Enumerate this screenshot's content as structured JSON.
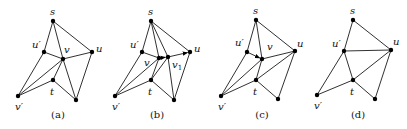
{
  "figure": {
    "panels": [
      {
        "id": "a",
        "caption": "(a)",
        "caption_pos": [
          58,
          118
        ],
        "nodes": [
          {
            "id": "s",
            "label": "s",
            "x": 53,
            "y": 21,
            "lx": 50,
            "ly": 15
          },
          {
            "id": "u_prime",
            "label": "u′",
            "x": 44,
            "y": 52,
            "lx": 32,
            "ly": 48
          },
          {
            "id": "v",
            "label": "v",
            "x": 63,
            "y": 59,
            "lx": 64,
            "ly": 53
          },
          {
            "id": "u",
            "label": "u",
            "x": 92,
            "y": 52,
            "lx": 96,
            "ly": 52
          },
          {
            "id": "t",
            "label": "t",
            "x": 53,
            "y": 80,
            "lx": 50,
            "ly": 95
          },
          {
            "id": "v_prime",
            "label": "v′",
            "x": 18,
            "y": 96,
            "lx": 15,
            "ly": 110
          },
          {
            "id": "w",
            "label": "",
            "x": 76,
            "y": 100
          }
        ],
        "edges": [
          [
            "s",
            "u_prime"
          ],
          [
            "s",
            "v"
          ],
          [
            "s",
            "u"
          ],
          [
            "u_prime",
            "v"
          ],
          [
            "v",
            "u"
          ],
          [
            "u_prime",
            "v_prime"
          ],
          [
            "v",
            "v_prime"
          ],
          [
            "v",
            "t"
          ],
          [
            "t",
            "v_prime"
          ],
          [
            "v",
            "w"
          ],
          [
            "t",
            "w"
          ],
          [
            "u",
            "w"
          ]
        ],
        "arrows": []
      },
      {
        "id": "b",
        "caption": "(b)",
        "caption_pos": [
          157,
          118
        ],
        "nodes": [
          {
            "id": "s",
            "label": "s",
            "x": 151,
            "y": 21,
            "lx": 148,
            "ly": 15
          },
          {
            "id": "u_prime",
            "label": "u′",
            "x": 142,
            "y": 52,
            "lx": 130,
            "ly": 48
          },
          {
            "id": "v",
            "label": "v",
            "x": 159,
            "y": 58,
            "lx": 144,
            "ly": 66
          },
          {
            "id": "v1",
            "label": "v1",
            "x": 168,
            "y": 57,
            "lx": 172,
            "ly": 68
          },
          {
            "id": "u",
            "label": "u",
            "x": 190,
            "y": 52,
            "lx": 194,
            "ly": 52
          },
          {
            "id": "t",
            "label": "t",
            "x": 151,
            "y": 80,
            "lx": 148,
            "ly": 95
          },
          {
            "id": "v_prime",
            "label": "v′",
            "x": 115,
            "y": 96,
            "lx": 112,
            "ly": 110
          },
          {
            "id": "w",
            "label": "",
            "x": 174,
            "y": 100
          }
        ],
        "edges": [
          [
            "s",
            "u_prime"
          ],
          [
            "s",
            "v"
          ],
          [
            "s",
            "v1"
          ],
          [
            "s",
            "u"
          ],
          [
            "u_prime",
            "v"
          ],
          [
            "u_prime",
            "v_prime"
          ],
          [
            "v",
            "v_prime"
          ],
          [
            "v",
            "t"
          ],
          [
            "v1",
            "t"
          ],
          [
            "t",
            "v_prime"
          ],
          [
            "v1",
            "w"
          ],
          [
            "t",
            "w"
          ],
          [
            "u",
            "w"
          ]
        ],
        "arrows": [
          [
            "v",
            "v1"
          ],
          [
            "v1",
            "u"
          ]
        ]
      },
      {
        "id": "c",
        "caption": "(c)",
        "caption_pos": [
          262,
          118
        ],
        "nodes": [
          {
            "id": "s",
            "label": "s",
            "x": 256,
            "y": 20,
            "lx": 253,
            "ly": 14
          },
          {
            "id": "u_prime",
            "label": "u′",
            "x": 247,
            "y": 52,
            "lx": 235,
            "ly": 46
          },
          {
            "id": "v",
            "label": "v",
            "x": 262,
            "y": 59,
            "lx": 267,
            "ly": 50
          },
          {
            "id": "u",
            "label": "u",
            "x": 295,
            "y": 51,
            "lx": 297,
            "ly": 47
          },
          {
            "id": "t",
            "label": "t",
            "x": 256,
            "y": 80,
            "lx": 253,
            "ly": 95
          },
          {
            "id": "v_prime",
            "label": "v′",
            "x": 221,
            "y": 96,
            "lx": 218,
            "ly": 110
          },
          {
            "id": "w",
            "label": "",
            "x": 278,
            "y": 99
          }
        ],
        "edges": [
          [
            "s",
            "u_prime"
          ],
          [
            "s",
            "v"
          ],
          [
            "s",
            "u"
          ],
          [
            "v",
            "u"
          ],
          [
            "t",
            "u"
          ],
          [
            "u_prime",
            "v_prime"
          ],
          [
            "v",
            "v_prime"
          ],
          [
            "v",
            "t"
          ],
          [
            "t",
            "v_prime"
          ],
          [
            "t",
            "w"
          ],
          [
            "u",
            "w"
          ]
        ],
        "arrows": [
          [
            "u_prime",
            "v"
          ]
        ]
      },
      {
        "id": "d",
        "caption": "(d)",
        "caption_pos": [
          358,
          118
        ],
        "nodes": [
          {
            "id": "s",
            "label": "s",
            "x": 353,
            "y": 20,
            "lx": 350,
            "ly": 14
          },
          {
            "id": "u_prime",
            "label": "u′",
            "x": 344,
            "y": 51,
            "lx": 332,
            "ly": 47
          },
          {
            "id": "u",
            "label": "u",
            "x": 391,
            "y": 50,
            "lx": 393,
            "ly": 45
          },
          {
            "id": "t",
            "label": "t",
            "x": 353,
            "y": 80,
            "lx": 350,
            "ly": 95
          },
          {
            "id": "v_prime",
            "label": "v′",
            "x": 317,
            "y": 95,
            "lx": 314,
            "ly": 109
          },
          {
            "id": "w",
            "label": "",
            "x": 375,
            "y": 99
          }
        ],
        "edges": [
          [
            "s",
            "u_prime"
          ],
          [
            "s",
            "u"
          ],
          [
            "u_prime",
            "u"
          ],
          [
            "u_prime",
            "t"
          ],
          [
            "u_prime",
            "v_prime"
          ],
          [
            "t",
            "v_prime"
          ],
          [
            "t",
            "u"
          ],
          [
            "t",
            "w"
          ],
          [
            "u",
            "w"
          ]
        ],
        "arrows": []
      }
    ]
  }
}
